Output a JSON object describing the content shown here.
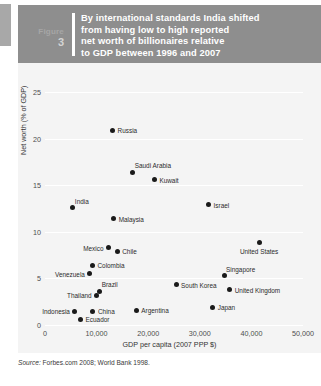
{
  "figure": {
    "label": "Figure",
    "number": "3",
    "title_lines": [
      "By international standards India shifted",
      "from having low to high reported",
      "net worth of billionaires relative",
      "to GDP between 1996 and 2007"
    ]
  },
  "source": {
    "prefix": "Source:",
    "text": " Forbes.com 2008; World Bank 1998."
  },
  "colors": {
    "banner": "#8e8e8e",
    "plot_background": "#f4f4f4",
    "gridline": "#ffffff",
    "marker": "#1a1a1a"
  },
  "chart_data": {
    "type": "scatter",
    "title": "By international standards India shifted from having low to high reported net worth of billionaires relative to GDP between 1996 and 2007",
    "xlabel": "GDP per capita (2007 PPP $)",
    "ylabel": "Net worth (% of GDP)",
    "xlim": [
      0,
      50000
    ],
    "ylim": [
      0,
      25
    ],
    "xticks": [
      "0",
      "10,000",
      "20,000",
      "30,000",
      "40,000",
      "50,000"
    ],
    "xtick_values": [
      0,
      10000,
      20000,
      30000,
      40000,
      50000
    ],
    "yticks": [
      "0",
      "5",
      "10",
      "15",
      "20",
      "25"
    ],
    "ytick_values": [
      0,
      5,
      10,
      15,
      20,
      25
    ],
    "grid": "horizontal",
    "legend": "none",
    "points": [
      {
        "name": "Russia",
        "x": 13100,
        "y": 20.9,
        "label_pos": "right"
      },
      {
        "name": "Saudi Arabia",
        "x": 17000,
        "y": 16.4,
        "label_pos": "above-right"
      },
      {
        "name": "Kuwait",
        "x": 21200,
        "y": 15.6,
        "label_pos": "right"
      },
      {
        "name": "Israel",
        "x": 31700,
        "y": 12.9,
        "label_pos": "right"
      },
      {
        "name": "India",
        "x": 5400,
        "y": 12.6,
        "label_pos": "above-right"
      },
      {
        "name": "Malaysia",
        "x": 13300,
        "y": 11.4,
        "label_pos": "right"
      },
      {
        "name": "United States",
        "x": 41500,
        "y": 8.8,
        "label_pos": "below"
      },
      {
        "name": "Mexico",
        "x": 12300,
        "y": 8.3,
        "label_pos": "left"
      },
      {
        "name": "Chile",
        "x": 14000,
        "y": 7.9,
        "label_pos": "right"
      },
      {
        "name": "Colombia",
        "x": 9200,
        "y": 6.4,
        "label_pos": "right"
      },
      {
        "name": "Venezuela",
        "x": 8700,
        "y": 5.5,
        "label_pos": "left"
      },
      {
        "name": "Singapore",
        "x": 34700,
        "y": 5.3,
        "label_pos": "above-right"
      },
      {
        "name": "South Korea",
        "x": 25400,
        "y": 4.3,
        "label_pos": "right"
      },
      {
        "name": "Brazil",
        "x": 10600,
        "y": 3.6,
        "label_pos": "above-right"
      },
      {
        "name": "United Kingdom",
        "x": 35800,
        "y": 3.8,
        "label_pos": "right"
      },
      {
        "name": "Thailand",
        "x": 10000,
        "y": 3.2,
        "label_pos": "left"
      },
      {
        "name": "Japan",
        "x": 32500,
        "y": 1.9,
        "label_pos": "right"
      },
      {
        "name": "Indonesia",
        "x": 5800,
        "y": 1.5,
        "label_pos": "left"
      },
      {
        "name": "China",
        "x": 9300,
        "y": 1.5,
        "label_pos": "right"
      },
      {
        "name": "Argentina",
        "x": 17700,
        "y": 1.6,
        "label_pos": "right"
      },
      {
        "name": "Ecuador",
        "x": 6900,
        "y": 0.6,
        "label_pos": "right"
      }
    ]
  }
}
